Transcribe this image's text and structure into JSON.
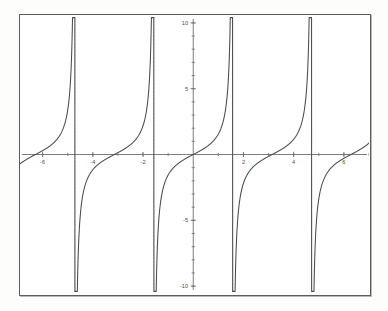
{
  "figure": {
    "kind": "cartesian-plot",
    "background_color": "#ffffff",
    "frame_color": "#5d5d5d",
    "curve_color": "#4a4a4a",
    "axis_color": "#6e6e6e",
    "asymptote_color": "#d9d2cf"
  },
  "chart_data": {
    "type": "line",
    "title": "",
    "subtitle": "",
    "xlabel": "",
    "ylabel": "",
    "function": "y = tan(x)",
    "xlim": [
      -6.9,
      7.0
    ],
    "ylim": [
      -10.6,
      10.6
    ],
    "grid": false,
    "legend": null,
    "legend_position": "none",
    "x_ticks": [
      -6,
      -4,
      -2,
      2,
      4,
      6
    ],
    "x_tick_labels": [
      "-6",
      "-4",
      "-2",
      "2",
      "4",
      "6"
    ],
    "x_minor_tick_step": 1,
    "y_ticks": [
      -10,
      -5,
      5,
      10
    ],
    "y_tick_labels": [
      "-10",
      "-5",
      "5",
      "10"
    ],
    "y_minor_tick_step": 1,
    "asymptotes": [
      -4.712,
      -1.571,
      1.571,
      4.712
    ],
    "zero_crossings": [
      -6.283,
      -3.142,
      0,
      3.142,
      6.283
    ],
    "clip_y": 10.4,
    "period": 3.14159,
    "branches": [
      {
        "name": "branch-left-edge",
        "x_start": -6.9,
        "x_end": -4.712
      },
      {
        "name": "branch-2",
        "x_start": -4.712,
        "x_end": -1.571
      },
      {
        "name": "branch-3",
        "x_start": -1.571,
        "x_end": 1.571
      },
      {
        "name": "branch-4",
        "x_start": 1.571,
        "x_end": 4.712
      },
      {
        "name": "branch-right-edge",
        "x_start": 4.712,
        "x_end": 7.0
      }
    ],
    "series": [
      {
        "name": "tan(x)",
        "color": "#4a4a4a",
        "values_note": "sampled analytically from y = tan(x), clipped at |y| = 10.4"
      }
    ]
  }
}
